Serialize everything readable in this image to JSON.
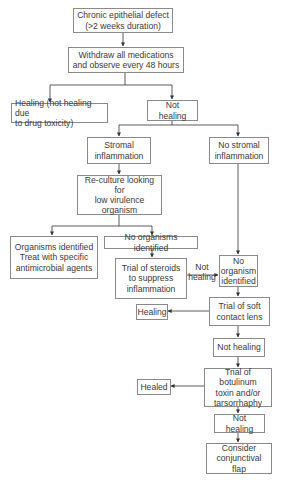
{
  "flowchart": {
    "nodes": {
      "start": "Chronic epithelial defect\n(>2 weeks duration)",
      "withdraw": "Withdraw all medications\nand observe every 48 hours",
      "healing_toxicity": "Healing (not healing due\nto drug toxicity)",
      "not_healing_1": "Not healing",
      "stromal": "Stromal\ninflammation",
      "no_stromal": "No stromal\ninflammation",
      "reculture": "Re-culture looking for\nlow virulence\norganism",
      "organisms_identified": "Organisms identified\nTreat with specific\nantimicrobial agents",
      "no_organisms": "No organisms identified",
      "steroids": "Trial of steroids\nto suppress\ninflammation",
      "no_organism_identified": "No\norganism\nidentified",
      "soft_lens": "Trial of soft\ncontact lens",
      "healing_2": "Healing",
      "not_healing_2": "Not healing",
      "botulinum": "Trial of botulinum\ntoxin and/or\ntarsorrhaphy",
      "healed": "Healed",
      "not_healing_3": "Not healing",
      "conjunctival_flap": "Consider\nconjunctival flap"
    },
    "edge_labels": {
      "steroids_to_no_organism": "Not\nhealing"
    },
    "colors": {
      "line": "#333333",
      "border": "#8a8a8a",
      "text": "#3a3a3a"
    }
  }
}
